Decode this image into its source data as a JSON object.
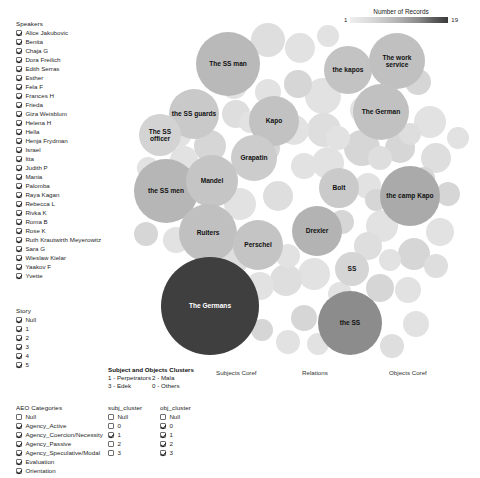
{
  "records_legend": {
    "title": "Number of Records",
    "min": "1",
    "max": "19",
    "gradient_low": "#efefef",
    "gradient_high": "#333333"
  },
  "speakers": {
    "title": "Speakers",
    "items": [
      {
        "label": "Alice Jakubovic",
        "checked": true
      },
      {
        "label": "Benita",
        "checked": true
      },
      {
        "label": "Chaja G",
        "checked": true
      },
      {
        "label": "Dora Freilich",
        "checked": true
      },
      {
        "label": "Edith Serras",
        "checked": true
      },
      {
        "label": "Esther",
        "checked": true
      },
      {
        "label": "Fela F",
        "checked": true
      },
      {
        "label": "Frances H",
        "checked": true
      },
      {
        "label": "Frieda",
        "checked": true
      },
      {
        "label": "Giza Weisblum",
        "checked": true
      },
      {
        "label": "Helena H",
        "checked": true
      },
      {
        "label": "Hella",
        "checked": true
      },
      {
        "label": "Henja Frydman",
        "checked": true
      },
      {
        "label": "Israel",
        "checked": true
      },
      {
        "label": "Itta",
        "checked": true
      },
      {
        "label": "Judith P",
        "checked": true
      },
      {
        "label": "Mania",
        "checked": true
      },
      {
        "label": "Palomba",
        "checked": true
      },
      {
        "label": "Raya Kagan",
        "checked": true
      },
      {
        "label": "Rebecca L",
        "checked": true
      },
      {
        "label": "Rivka K",
        "checked": true
      },
      {
        "label": "Roma B",
        "checked": true
      },
      {
        "label": "Rose K",
        "checked": true
      },
      {
        "label": "Ruth Krautwirth Meyerowitz",
        "checked": true
      },
      {
        "label": "Sara G",
        "checked": true
      },
      {
        "label": "Wieslaw Kielar",
        "checked": true
      },
      {
        "label": "Yaakov F",
        "checked": true
      },
      {
        "label": "Yvette",
        "checked": true
      }
    ]
  },
  "story": {
    "title": "Story",
    "items": [
      {
        "label": "Null",
        "checked": true
      },
      {
        "label": "1",
        "checked": true
      },
      {
        "label": "2",
        "checked": true
      },
      {
        "label": "3",
        "checked": true
      },
      {
        "label": "4",
        "checked": true
      },
      {
        "label": "5",
        "checked": true
      }
    ]
  },
  "aeo": {
    "title": "AEO Categories",
    "items": [
      {
        "label": "Null",
        "checked": false
      },
      {
        "label": "Agency_Active",
        "checked": true
      },
      {
        "label": "Agency_Coercion/Necessity",
        "checked": true
      },
      {
        "label": "Agency_Passive",
        "checked": true
      },
      {
        "label": "Agency_Speculative/Modal",
        "checked": true
      },
      {
        "label": "Evaluation",
        "checked": true
      },
      {
        "label": "Orientation",
        "checked": true
      }
    ]
  },
  "subj_cluster": {
    "title": "subj_cluster",
    "items": [
      {
        "label": "Null",
        "checked": false
      },
      {
        "label": "0",
        "checked": false
      },
      {
        "label": "1",
        "checked": true
      },
      {
        "label": "2",
        "checked": false
      },
      {
        "label": "3",
        "checked": false
      }
    ]
  },
  "obj_cluster": {
    "title": "obj_cluster",
    "items": [
      {
        "label": "Null",
        "checked": false
      },
      {
        "label": "0",
        "checked": true
      },
      {
        "label": "1",
        "checked": true
      },
      {
        "label": "2",
        "checked": true
      },
      {
        "label": "3",
        "checked": true
      }
    ]
  },
  "cluster_key": {
    "title": "Subject and Objects Clusters",
    "entries": [
      {
        "code": "1 - Perpetrators",
        "code2": "2 - Mala"
      },
      {
        "code": "3 - Edek",
        "code2": "0 - Others"
      }
    ]
  },
  "axis_captions": {
    "subjects": "Subjects Coref",
    "relations": "Relations",
    "objects": "Objects Coref"
  },
  "chart_data": {
    "type": "bubble",
    "title": "Number of Records",
    "value_label": "Number of Records",
    "value_range": [
      1,
      19
    ],
    "color_scale": "grayscale light(1) to dark(19)",
    "bubbles": [
      {
        "label": "The SS man",
        "x": 110,
        "y": 46,
        "r": 32,
        "value": 7,
        "color": "#b9b9b9"
      },
      {
        "label": "the SS guards",
        "x": 76,
        "y": 96,
        "r": 25,
        "value": 5,
        "color": "#c9c9c9"
      },
      {
        "label": "The SS officer",
        "x": 42,
        "y": 117,
        "r": 21,
        "value": 4,
        "color": "#d3d3d3"
      },
      {
        "label": "the SS men",
        "x": 48,
        "y": 173,
        "r": 32,
        "value": 7,
        "color": "#b6b6b6"
      },
      {
        "label": "Kapo",
        "x": 156,
        "y": 103,
        "r": 25,
        "value": 6,
        "color": "#c2c2c2"
      },
      {
        "label": "Grapatin",
        "x": 136,
        "y": 140,
        "r": 23,
        "value": 5,
        "color": "#cccccc"
      },
      {
        "label": "Mandel",
        "x": 94,
        "y": 163,
        "r": 26,
        "value": 6,
        "color": "#c5c5c5"
      },
      {
        "label": "Ruiters",
        "x": 90,
        "y": 215,
        "r": 29,
        "value": 6,
        "color": "#c0c0c0"
      },
      {
        "label": "Perschel",
        "x": 140,
        "y": 227,
        "r": 25,
        "value": 6,
        "color": "#c4c4c4"
      },
      {
        "label": "Drexler",
        "x": 199,
        "y": 213,
        "r": 25,
        "value": 7,
        "color": "#b3b3b3"
      },
      {
        "label": "Bolt",
        "x": 221,
        "y": 170,
        "r": 20,
        "value": 5,
        "color": "#cacaca"
      },
      {
        "label": "SS",
        "x": 234,
        "y": 251,
        "r": 17,
        "value": 4,
        "color": "#d5d5d5"
      },
      {
        "label": "the kapos",
        "x": 230,
        "y": 52,
        "r": 24,
        "value": 6,
        "color": "#c3c3c3"
      },
      {
        "label": "The work service",
        "x": 279,
        "y": 43,
        "r": 28,
        "value": 6,
        "color": "#c0c0c0"
      },
      {
        "label": "The German",
        "x": 263,
        "y": 94,
        "r": 28,
        "value": 6,
        "color": "#c1c1c1"
      },
      {
        "label": "the camp Kapo",
        "x": 292,
        "y": 178,
        "r": 30,
        "value": 8,
        "color": "#aaaaaa"
      },
      {
        "label": "The Germans",
        "x": 92,
        "y": 288,
        "r": 49,
        "value": 19,
        "color": "#3f3f3f"
      },
      {
        "label": "the SS",
        "x": 232,
        "y": 305,
        "r": 32,
        "value": 12,
        "color": "#8c8c8c"
      }
    ]
  }
}
